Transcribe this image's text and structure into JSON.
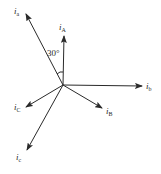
{
  "diagram": {
    "type": "phasor-diagram",
    "origin": [
      63,
      85
    ],
    "line_color": "#2a2a2a",
    "vectors": [
      {
        "id": "ia_lower",
        "symbol": "i",
        "subscript": "a",
        "tip": [
          26,
          14
        ],
        "label_pos": [
          14,
          7
        ]
      },
      {
        "id": "iA_upper",
        "symbol": "i",
        "subscript": "A",
        "tip": [
          64,
          36
        ],
        "label_pos": [
          59,
          23
        ]
      },
      {
        "id": "ib_lower",
        "symbol": "i",
        "subscript": "b",
        "tip": [
          142,
          86
        ],
        "label_pos": [
          146,
          82
        ]
      },
      {
        "id": "iB_upper",
        "symbol": "i",
        "subscript": "B",
        "tip": [
          102,
          108
        ],
        "label_pos": [
          106,
          107
        ]
      },
      {
        "id": "iC_upper",
        "symbol": "i",
        "subscript": "C",
        "tip": [
          26,
          107
        ],
        "label_pos": [
          14,
          103
        ]
      },
      {
        "id": "ic_lower",
        "symbol": "i",
        "subscript": "c",
        "tip": [
          27,
          150
        ],
        "label_pos": [
          16,
          153
        ]
      }
    ],
    "angle_annotation": {
      "text": "30°",
      "between": [
        "i_a",
        "i_A"
      ],
      "label_pos": [
        47,
        49
      ]
    }
  }
}
